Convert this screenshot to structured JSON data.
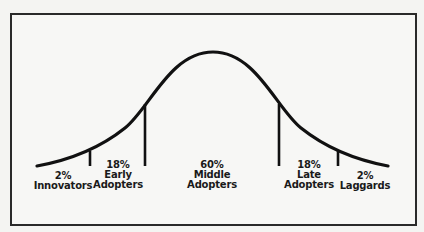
{
  "diagram": {
    "segments": [
      {
        "id": "innovators",
        "percent": "2%",
        "line1": "Innovators",
        "line2": ""
      },
      {
        "id": "early",
        "percent": "18%",
        "line1": "Early",
        "line2": "Adopters"
      },
      {
        "id": "middle",
        "percent": "60%",
        "line1": "Middle",
        "line2": "Adopters"
      },
      {
        "id": "late",
        "percent": "18%",
        "line1": "Late",
        "line2": "Adopters"
      },
      {
        "id": "laggards",
        "percent": "2%",
        "line1": "Laggards",
        "line2": ""
      }
    ],
    "colors": {
      "line": "#111111",
      "background": "#f7f7f5",
      "frame": "#2a2a2a"
    }
  }
}
